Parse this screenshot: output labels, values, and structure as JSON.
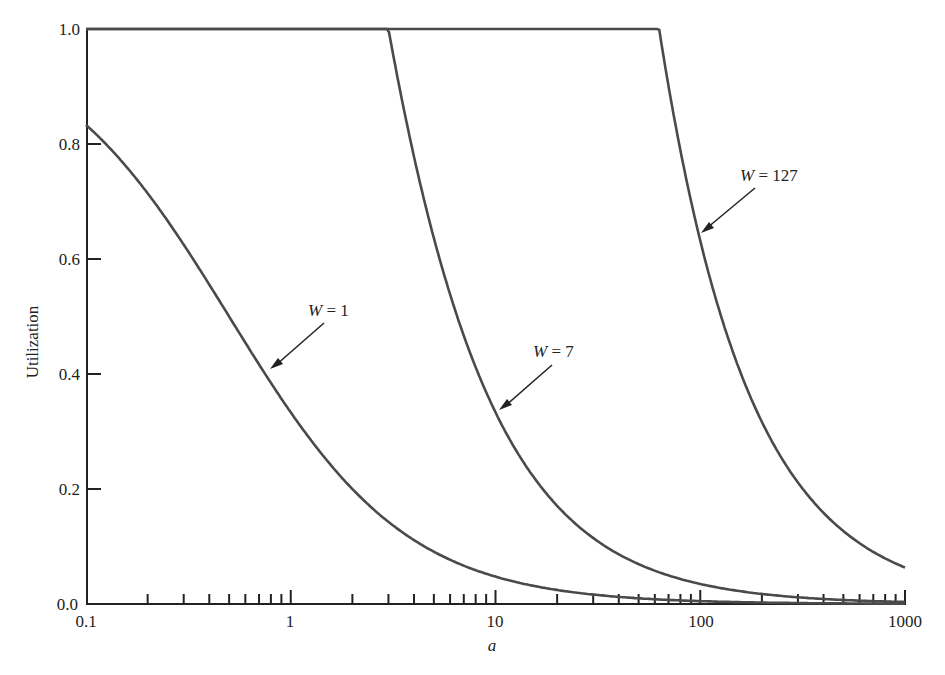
{
  "chart_data": {
    "type": "line",
    "title": "",
    "xlabel": "a",
    "ylabel": "Utilization",
    "xscale": "log",
    "xlim": [
      0.1,
      1000
    ],
    "ylim": [
      0.0,
      1.0
    ],
    "grid": false,
    "legend": "none (inline arrow annotations)",
    "x_tick_labels": [
      "0.1",
      "1",
      "10",
      "100",
      "1000"
    ],
    "y_tick_labels": [
      "0.0",
      "0.2",
      "0.4",
      "0.6",
      "0.8",
      "1.0"
    ],
    "formula": "U = 1 if W >= 2a+1, else W/(2a+1)",
    "series": [
      {
        "name": "W = 1",
        "W": 1,
        "points": [
          [
            0.1,
            0.833
          ],
          [
            0.2,
            0.714
          ],
          [
            0.5,
            0.5
          ],
          [
            0.8,
            0.385
          ],
          [
            1,
            0.333
          ],
          [
            2,
            0.2
          ],
          [
            5,
            0.091
          ],
          [
            10,
            0.048
          ],
          [
            100,
            0.005
          ],
          [
            1000,
            0.0005
          ]
        ]
      },
      {
        "name": "W = 7",
        "W": 7,
        "points": [
          [
            0.1,
            1.0
          ],
          [
            1,
            1.0
          ],
          [
            3,
            1.0
          ],
          [
            5,
            0.636
          ],
          [
            10,
            0.333
          ],
          [
            20,
            0.171
          ],
          [
            50,
            0.069
          ],
          [
            100,
            0.035
          ],
          [
            1000,
            0.0035
          ]
        ]
      },
      {
        "name": "W = 127",
        "W": 127,
        "points": [
          [
            0.1,
            1.0
          ],
          [
            10,
            1.0
          ],
          [
            63,
            1.0
          ],
          [
            100,
            0.632
          ],
          [
            200,
            0.317
          ],
          [
            500,
            0.127
          ],
          [
            1000,
            0.0635
          ]
        ]
      }
    ],
    "annotations": [
      {
        "text": "W = 1",
        "arrow_to": [
          0.8,
          0.385
        ]
      },
      {
        "text": "W = 7",
        "arrow_to": [
          10,
          0.333
        ]
      },
      {
        "text": "W = 127",
        "arrow_to": [
          100,
          0.632
        ]
      }
    ]
  },
  "labels": {
    "xlabel": "a",
    "ylabel": "Utilization",
    "x_ticks": [
      "0.1",
      "1",
      "10",
      "100",
      "1000"
    ],
    "y_ticks": [
      "0.0",
      "0.2",
      "0.4",
      "0.6",
      "0.8",
      "1.0"
    ],
    "annot_w1_var": "W",
    "annot_w1_rest": " = 1",
    "annot_w7_var": "W",
    "annot_w7_rest": " = 7",
    "annot_w127_var": "W",
    "annot_w127_rest": " = 127"
  },
  "style": {
    "line_color": "#4a4a4a",
    "axis_color": "#222222"
  }
}
